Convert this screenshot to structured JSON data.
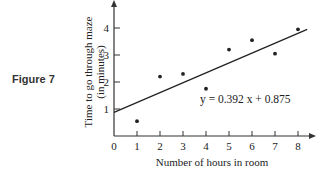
{
  "figure": {
    "label": "Figure 7"
  },
  "chart_data": {
    "type": "scatter",
    "title": "",
    "xlabel": "Number of hours in room",
    "ylabel": "Time to go through maze (in minutes)",
    "ylabel_line1": "Time to go through maze",
    "ylabel_line2": "(in minutes)",
    "x_ticks": [
      "0",
      "1",
      "2",
      "3",
      "4",
      "5",
      "6",
      "7",
      "8"
    ],
    "y_ticks": [
      "1",
      "2",
      "3",
      "4"
    ],
    "xlim": [
      0,
      8.5
    ],
    "ylim": [
      0,
      5
    ],
    "grid": false,
    "points": [
      {
        "x": 1,
        "y": 0.55
      },
      {
        "x": 2,
        "y": 2.2
      },
      {
        "x": 3,
        "y": 2.3
      },
      {
        "x": 4,
        "y": 1.75
      },
      {
        "x": 5,
        "y": 3.2
      },
      {
        "x": 6,
        "y": 3.55
      },
      {
        "x": 7,
        "y": 3.05
      },
      {
        "x": 8,
        "y": 3.95
      }
    ],
    "regression": {
      "slope": 0.392,
      "intercept": 0.875,
      "label": "y = 0.392x + 0.875"
    },
    "equation_label": "y = 0.392 x + 0.875"
  }
}
